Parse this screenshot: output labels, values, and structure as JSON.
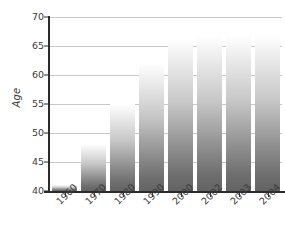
{
  "chart_data": {
    "type": "bar",
    "title": "",
    "subtitle": "",
    "xlabel": "",
    "ylabel": "Age",
    "categories": [
      "1960",
      "1970",
      "1980",
      "1990",
      "2000",
      "2002",
      "2003",
      "2004"
    ],
    "values": [
      41,
      48,
      55,
      62,
      66,
      66.5,
      66.8,
      67
    ],
    "series": [
      {
        "name": "Age",
        "values": [
          41,
          48,
          55,
          62,
          66,
          66.5,
          66.8,
          67
        ]
      }
    ],
    "ylim": [
      40,
      70
    ],
    "xlim": null,
    "yticks": [
      40,
      45,
      50,
      55,
      60,
      65,
      70
    ],
    "ytick_labels": [
      "40",
      "45",
      "50",
      "55",
      "60",
      "65",
      "70"
    ],
    "xtick_labels": [
      "1960",
      "1970",
      "1980",
      "1990",
      "2000",
      "2002",
      "2003",
      "2004"
    ],
    "grid": true,
    "grid_axis": "y",
    "legend": null,
    "legend_position": "none",
    "annotations": [],
    "bar_fill": "vertical gradient white-to-gray",
    "colors": {
      "bar_top": "#ffffff",
      "bar_bottom": "#636363",
      "axis": "#2b2b2b",
      "gridline": "#c9c9c9",
      "text": "#3b3b3b",
      "background": "#ffffff"
    }
  }
}
